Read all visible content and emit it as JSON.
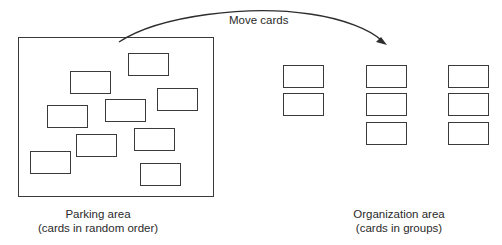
{
  "diagram": {
    "arrow_label": "Move cards",
    "parking_area": {
      "title": "Parking area",
      "subtitle": "(cards in random order)",
      "card_count": 9,
      "cards": [
        {
          "x": 128,
          "y": 53
        },
        {
          "x": 70,
          "y": 71
        },
        {
          "x": 157,
          "y": 88
        },
        {
          "x": 105,
          "y": 99
        },
        {
          "x": 47,
          "y": 105
        },
        {
          "x": 134,
          "y": 128
        },
        {
          "x": 76,
          "y": 134
        },
        {
          "x": 30,
          "y": 151
        },
        {
          "x": 140,
          "y": 163
        }
      ]
    },
    "organization_area": {
      "title": "Organization area",
      "subtitle": "(cards in groups)",
      "groups": [
        {
          "name": "group-1",
          "card_count": 2
        },
        {
          "name": "group-2",
          "card_count": 3
        },
        {
          "name": "group-3",
          "card_count": 3
        }
      ]
    },
    "colors": {
      "stroke": "#3a3a3a",
      "text": "#2a2a2a",
      "background": "#ffffff"
    }
  }
}
